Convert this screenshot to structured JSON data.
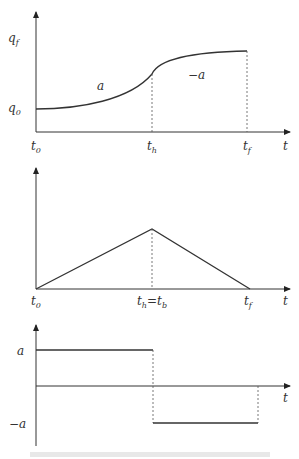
{
  "diagram": {
    "type": "trajectory profiles (position, velocity, acceleration)",
    "panels": [
      {
        "name": "position",
        "y_labels": [
          "q_f",
          "q_0"
        ],
        "x_labels": [
          "t_0",
          "t_h",
          "t_f",
          "t"
        ],
        "segment_labels": [
          "a",
          "−a"
        ]
      },
      {
        "name": "velocity",
        "x_labels": [
          "t_0",
          "t_h = t_b",
          "t_f",
          "t"
        ]
      },
      {
        "name": "acceleration",
        "y_labels": [
          "a",
          "−a"
        ],
        "x_labels": [
          "t"
        ]
      }
    ]
  },
  "labels": {
    "p1_qf": "q",
    "p1_qf_sub": "f",
    "p1_q0": "q",
    "p1_q0_sub": "0",
    "p1_a": "a",
    "p1_neg_a": "−a",
    "p1_t0": "t",
    "p1_t0_sub": "0",
    "p1_th": "t",
    "p1_th_sub": "h",
    "p1_tf": "t",
    "p1_tf_sub": "f",
    "p1_t": "t",
    "p2_t0": "t",
    "p2_t0_sub": "0",
    "p2_th": "t",
    "p2_th_sub": "h",
    "p2_eq": "=",
    "p2_tb": "t",
    "p2_tb_sub": "b",
    "p2_tf": "t",
    "p2_tf_sub": "f",
    "p2_t": "t",
    "p3_a": "a",
    "p3_neg_a": "−a",
    "p3_t": "t"
  },
  "caption": "Blurred source caption (illegible)"
}
